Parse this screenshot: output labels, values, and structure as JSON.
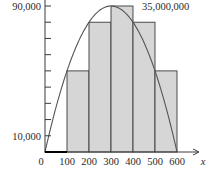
{
  "chart_data": {
    "type": "bar",
    "title": "",
    "annotation": "35,000,000",
    "xlabel": "x",
    "ylabel": "",
    "x_tick_labels": [
      "0",
      "100",
      "200",
      "300",
      "400",
      "500",
      "600"
    ],
    "y_tick_labels_shown": [
      "10,000",
      "90,000"
    ],
    "y_ticks": [
      10000,
      20000,
      30000,
      40000,
      50000,
      60000,
      70000,
      80000,
      90000
    ],
    "xlim": [
      0,
      650
    ],
    "ylim": [
      0,
      95000
    ],
    "grid": false,
    "bins": [
      {
        "from": 0,
        "to": 100,
        "height": 0
      },
      {
        "from": 100,
        "to": 200,
        "height": 50000
      },
      {
        "from": 200,
        "to": 300,
        "height": 80000
      },
      {
        "from": 300,
        "to": 400,
        "height": 90000
      },
      {
        "from": 400,
        "to": 500,
        "height": 80000
      },
      {
        "from": 500,
        "to": 600,
        "height": 50000
      }
    ],
    "curve": {
      "type": "line",
      "description": "parabola through (0,0), peak (300,90000), (600,0)",
      "x": [
        0,
        100,
        200,
        300,
        400,
        500,
        600
      ],
      "y": [
        0,
        50000,
        80000,
        90000,
        80000,
        50000,
        0
      ]
    },
    "colors": {
      "bar_fill": "#d6d6d6",
      "bar_stroke": "#3a3a3a",
      "curve": "#555555",
      "axis": "#3a3a3a"
    }
  }
}
